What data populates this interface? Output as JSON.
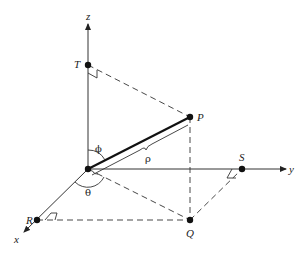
{
  "diagram": {
    "type": "3D spherical coordinates",
    "axes": {
      "x": "x",
      "y": "y",
      "z": "z"
    },
    "points": {
      "T": "T",
      "P": "P",
      "S": "S",
      "Q": "Q",
      "R": "R"
    },
    "symbols": {
      "phi": "ϕ",
      "theta": "θ",
      "rho": "ρ"
    },
    "colors": {
      "line": "#333333",
      "background": "#ffffff"
    }
  }
}
